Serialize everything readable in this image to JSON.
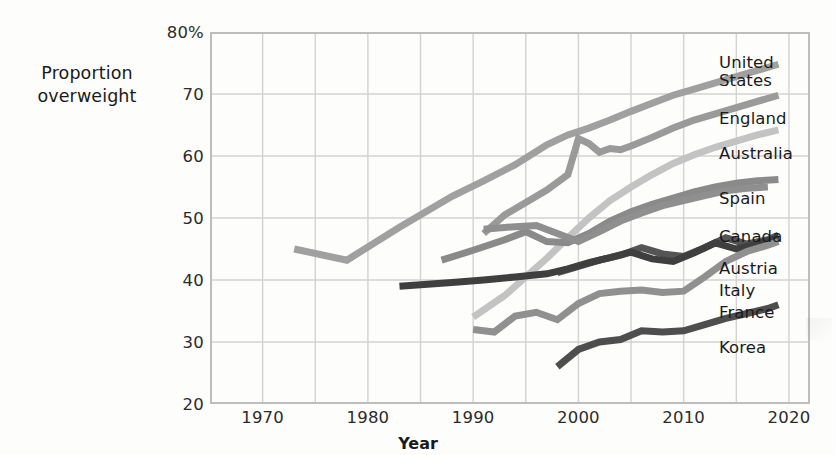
{
  "axes": {
    "y_title_lines": [
      "Proportion",
      "overweight"
    ],
    "x_title": "Year",
    "y_ticks": [
      "80%",
      "70",
      "60",
      "50",
      "40",
      "30",
      "20"
    ],
    "x_ticks": [
      "1970",
      "1980",
      "1990",
      "2000",
      "2010",
      "2020"
    ]
  },
  "legend": {
    "items": [
      {
        "label": "United States",
        "lines": [
          "United",
          "States"
        ]
      },
      {
        "label": "England",
        "lines": [
          "England"
        ]
      },
      {
        "label": "Australia",
        "lines": [
          "Australia"
        ]
      },
      {
        "label": "Spain",
        "lines": [
          "Spain"
        ]
      },
      {
        "label": "Canada",
        "lines": [
          "Canada"
        ]
      },
      {
        "label": "Austria",
        "lines": [
          "Austria"
        ]
      },
      {
        "label": "Italy",
        "lines": [
          "Italy"
        ]
      },
      {
        "label": "France",
        "lines": [
          "France"
        ]
      },
      {
        "label": "Korea",
        "lines": [
          "Korea"
        ]
      }
    ]
  },
  "chart_data": {
    "type": "line",
    "title": "",
    "xlabel": "Year",
    "ylabel": "Proportion overweight",
    "xlim": [
      1965,
      2022
    ],
    "ylim": [
      20,
      80
    ],
    "yticks": [
      20,
      30,
      40,
      50,
      60,
      70,
      80
    ],
    "xticks": [
      1970,
      1980,
      1990,
      2000,
      2010,
      2020
    ],
    "ytick_labels": [
      "20",
      "30",
      "40",
      "50",
      "60",
      "70",
      "80%"
    ],
    "grid": true,
    "legend_position": "right-of-plot-at-line-ends",
    "y_unit": "percent",
    "series": [
      {
        "name": "United States",
        "color": "#a0a0a0",
        "points": [
          [
            1973,
            45.0
          ],
          [
            1978,
            43.2
          ],
          [
            1983,
            48.5
          ],
          [
            1988,
            53.5
          ],
          [
            1991,
            56.0
          ],
          [
            1994,
            58.6
          ],
          [
            1997,
            61.8
          ],
          [
            1999,
            63.4
          ],
          [
            2001,
            64.5
          ],
          [
            2003,
            65.8
          ],
          [
            2005,
            67.2
          ],
          [
            2007,
            68.5
          ],
          [
            2009,
            69.8
          ],
          [
            2011,
            70.8
          ],
          [
            2013,
            71.8
          ],
          [
            2015,
            72.8
          ],
          [
            2017,
            73.8
          ],
          [
            2019,
            74.8
          ]
        ]
      },
      {
        "name": "England",
        "color": "#9a9a9a",
        "points": [
          [
            1991,
            47.5
          ],
          [
            1993,
            50.5
          ],
          [
            1995,
            52.5
          ],
          [
            1997,
            54.5
          ],
          [
            1999,
            57.0
          ],
          [
            2000,
            62.8
          ],
          [
            2001,
            62.0
          ],
          [
            2002,
            60.6
          ],
          [
            2003,
            61.2
          ],
          [
            2004,
            61.0
          ],
          [
            2005,
            61.6
          ],
          [
            2007,
            63.0
          ],
          [
            2009,
            64.5
          ],
          [
            2011,
            65.8
          ],
          [
            2013,
            66.8
          ],
          [
            2015,
            67.8
          ],
          [
            2017,
            68.8
          ],
          [
            2019,
            69.8
          ]
        ]
      },
      {
        "name": "Australia",
        "color": "#c3c3c3",
        "points": [
          [
            1990,
            34.0
          ],
          [
            1993,
            37.5
          ],
          [
            1995,
            40.5
          ],
          [
            1997,
            43.5
          ],
          [
            1999,
            46.8
          ],
          [
            2001,
            50.0
          ],
          [
            2003,
            52.8
          ],
          [
            2005,
            55.0
          ],
          [
            2007,
            57.0
          ],
          [
            2009,
            58.8
          ],
          [
            2011,
            60.2
          ],
          [
            2013,
            61.4
          ],
          [
            2015,
            62.4
          ],
          [
            2017,
            63.4
          ],
          [
            2019,
            64.2
          ]
        ]
      },
      {
        "name": "Spain",
        "color": "#8a8a8a",
        "points": [
          [
            1987,
            43.2
          ],
          [
            1990,
            44.8
          ],
          [
            1993,
            46.5
          ],
          [
            1995,
            47.8
          ],
          [
            1997,
            46.2
          ],
          [
            1999,
            46.0
          ],
          [
            2001,
            47.5
          ],
          [
            2003,
            49.5
          ],
          [
            2005,
            51.0
          ],
          [
            2007,
            52.2
          ],
          [
            2009,
            53.2
          ],
          [
            2011,
            54.2
          ],
          [
            2013,
            55.0
          ],
          [
            2015,
            55.6
          ],
          [
            2017,
            56.0
          ],
          [
            2019,
            56.2
          ]
        ]
      },
      {
        "name": "Canada",
        "color": "#8f8f8f",
        "points": [
          [
            1991,
            48.2
          ],
          [
            1994,
            48.6
          ],
          [
            1996,
            48.8
          ],
          [
            1998,
            47.5
          ],
          [
            2000,
            46.2
          ],
          [
            2002,
            47.8
          ],
          [
            2004,
            49.5
          ],
          [
            2006,
            50.8
          ],
          [
            2008,
            52.0
          ],
          [
            2010,
            52.8
          ],
          [
            2012,
            53.6
          ],
          [
            2014,
            54.4
          ],
          [
            2016,
            54.8
          ],
          [
            2018,
            55.0
          ]
        ]
      },
      {
        "name": "Austria",
        "color": "#555555",
        "points": [
          [
            1998,
            41.2
          ],
          [
            2000,
            42.2
          ],
          [
            2002,
            43.2
          ],
          [
            2004,
            44.0
          ],
          [
            2006,
            45.2
          ],
          [
            2008,
            44.2
          ],
          [
            2010,
            43.8
          ],
          [
            2012,
            45.2
          ],
          [
            2014,
            46.8
          ],
          [
            2016,
            45.8
          ],
          [
            2018,
            46.5
          ],
          [
            2019,
            47.2
          ]
        ]
      },
      {
        "name": "Italy",
        "color": "#3f3f3f",
        "points": [
          [
            1983,
            39.0
          ],
          [
            1988,
            39.6
          ],
          [
            1991,
            40.0
          ],
          [
            1994,
            40.5
          ],
          [
            1997,
            41.0
          ],
          [
            1999,
            41.8
          ],
          [
            2001,
            42.8
          ],
          [
            2003,
            43.6
          ],
          [
            2005,
            44.5
          ],
          [
            2007,
            43.4
          ],
          [
            2009,
            43.0
          ],
          [
            2011,
            44.4
          ],
          [
            2013,
            46.0
          ],
          [
            2015,
            45.0
          ],
          [
            2017,
            45.8
          ],
          [
            2019,
            46.8
          ]
        ]
      },
      {
        "name": "France",
        "color": "#909090",
        "points": [
          [
            1990,
            32.0
          ],
          [
            1992,
            31.6
          ],
          [
            1994,
            34.2
          ],
          [
            1996,
            34.8
          ],
          [
            1998,
            33.6
          ],
          [
            2000,
            36.2
          ],
          [
            2002,
            37.8
          ],
          [
            2004,
            38.2
          ],
          [
            2006,
            38.4
          ],
          [
            2008,
            38.0
          ],
          [
            2010,
            38.2
          ],
          [
            2012,
            40.5
          ],
          [
            2014,
            43.0
          ],
          [
            2016,
            44.6
          ],
          [
            2018,
            45.6
          ],
          [
            2019,
            46.2
          ]
        ]
      },
      {
        "name": "Korea",
        "color": "#4e4e4e",
        "points": [
          [
            1998,
            26.0
          ],
          [
            2000,
            28.8
          ],
          [
            2002,
            30.0
          ],
          [
            2004,
            30.4
          ],
          [
            2006,
            31.8
          ],
          [
            2008,
            31.6
          ],
          [
            2010,
            31.8
          ],
          [
            2012,
            32.8
          ],
          [
            2014,
            33.8
          ],
          [
            2016,
            34.6
          ],
          [
            2018,
            35.4
          ],
          [
            2019,
            36.0
          ]
        ]
      }
    ]
  },
  "plot_style": {
    "grid_color": "#d2d2d2",
    "frame_color": "#bdbdbd",
    "background": "#ffffff",
    "line_width": 7
  },
  "legend_layout": [
    {
      "name": "United States",
      "top": 22
    },
    {
      "name": "England",
      "top": 78
    },
    {
      "name": "Australia",
      "top": 113
    },
    {
      "name": "Spain",
      "top": 158
    },
    {
      "name": "Canada",
      "top": 196
    },
    {
      "name": "Austria",
      "top": 228
    },
    {
      "name": "Italy",
      "top": 250
    },
    {
      "name": "France",
      "top": 272
    },
    {
      "name": "Korea",
      "top": 307
    }
  ]
}
